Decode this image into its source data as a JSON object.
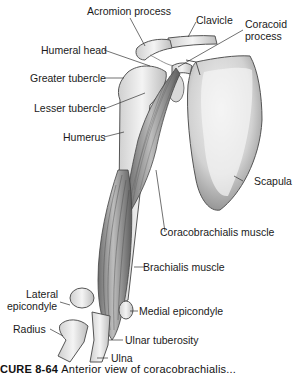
{
  "figure": {
    "caption_label": "CURE 8-64",
    "caption_text": "Anterior view of coracobrachialis...",
    "background": "#ffffff",
    "line_color": "#333333",
    "bone_color": "#e8e8e8",
    "muscle_color": "#9a9a9a"
  },
  "labels": {
    "acromion_process": "Acromion process",
    "clavicle": "Clavicle",
    "coracoid_process_1": "Coracoid",
    "coracoid_process_2": "process",
    "humeral_head": "Humeral head",
    "greater_tubercle": "Greater tubercle",
    "lesser_tubercle": "Lesser tubercle",
    "humerus": "Humerus",
    "scapula": "Scapula",
    "coracobrachialis_muscle": "Coracobrachialis muscle",
    "brachialis_muscle": "Brachialis muscle",
    "lateral_epicondyle_1": "Lateral",
    "lateral_epicondyle_2": "epicondyle",
    "medial_epicondyle": "Medial epicondyle",
    "radius": "Radius",
    "ulnar_tuberosity": "Ulnar tuberosity",
    "ulna": "Ulna"
  }
}
